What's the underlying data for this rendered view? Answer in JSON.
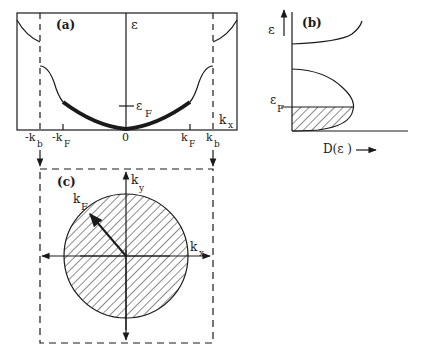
{
  "figure": {
    "panel_a": {
      "label": "(a)",
      "y_axis_label": "ε",
      "x_axis_label": "k",
      "x_axis_sub": "x",
      "fermi_label": "ε",
      "fermi_sub": "F",
      "ticks": [
        {
          "main": "-k",
          "sub": "b"
        },
        {
          "main": "-k",
          "sub": "F"
        },
        {
          "main": "0",
          "sub": ""
        },
        {
          "main": "k",
          "sub": "F"
        },
        {
          "main": "k",
          "sub": "b"
        }
      ]
    },
    "panel_b": {
      "label": "(b)",
      "y_axis_label": "ε",
      "fermi_label": "ε",
      "fermi_sub": "F",
      "x_axis_label": "D(ε )"
    },
    "panel_c": {
      "label": "(c)",
      "ky_label": "k",
      "ky_sub": "y",
      "kx_label": "k",
      "kx_sub": "x",
      "kf_label": "k",
      "kf_sub": "F"
    },
    "colors": {
      "ink": "#1a1a1a",
      "background": "#ffffff"
    }
  }
}
